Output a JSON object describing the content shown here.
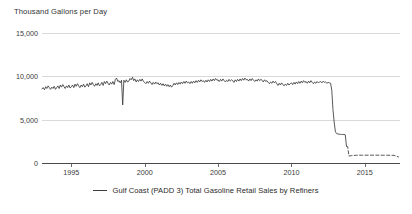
{
  "chart_data": {
    "type": "line",
    "title": "",
    "ylabel": "Thousand Gallons per Day",
    "xlabel": "",
    "ylim": [
      0,
      15000
    ],
    "xlim": [
      1993,
      2017.4
    ],
    "grid": true,
    "legend_position": "bottom-center",
    "yticks": [
      0,
      5000,
      10000,
      15000
    ],
    "ytick_labels": [
      "0",
      "5,000",
      "10,000",
      "15,000"
    ],
    "xticks": [
      1995,
      2000,
      2005,
      2010,
      2015
    ],
    "xtick_labels": [
      "1995",
      "2000",
      "2005",
      "2010",
      "2015"
    ],
    "series": [
      {
        "name": "Gulf Coast (PADD 3) Total Gasoline Retail Sales by Refiners",
        "color": "#3a3a3a",
        "style": "solid",
        "x": [
          1993.0,
          1993.08,
          1993.17,
          1993.25,
          1993.33,
          1993.42,
          1993.5,
          1993.58,
          1993.67,
          1993.75,
          1993.83,
          1993.92,
          1994.0,
          1994.08,
          1994.17,
          1994.25,
          1994.33,
          1994.42,
          1994.5,
          1994.58,
          1994.67,
          1994.75,
          1994.83,
          1994.92,
          1995.0,
          1995.08,
          1995.17,
          1995.25,
          1995.33,
          1995.42,
          1995.5,
          1995.58,
          1995.67,
          1995.75,
          1995.83,
          1995.92,
          1996.0,
          1996.08,
          1996.17,
          1996.25,
          1996.33,
          1996.42,
          1996.5,
          1996.58,
          1996.67,
          1996.75,
          1996.83,
          1996.92,
          1997.0,
          1997.08,
          1997.17,
          1997.25,
          1997.33,
          1997.42,
          1997.5,
          1997.58,
          1997.67,
          1997.75,
          1997.83,
          1997.92,
          1998.0,
          1998.08,
          1998.17,
          1998.25,
          1998.33,
          1998.42,
          1998.5,
          1998.58,
          1998.67,
          1998.75,
          1998.83,
          1998.92,
          1999.0,
          1999.08,
          1999.17,
          1999.25,
          1999.33,
          1999.42,
          1999.5,
          1999.58,
          1999.67,
          1999.75,
          1999.83,
          1999.92,
          2000.0,
          2000.08,
          2000.17,
          2000.25,
          2000.33,
          2000.42,
          2000.5,
          2000.58,
          2000.67,
          2000.75,
          2000.83,
          2000.92,
          2001.0,
          2001.08,
          2001.17,
          2001.25,
          2001.33,
          2001.42,
          2001.5,
          2001.58,
          2001.67,
          2001.75,
          2001.83,
          2001.92,
          2002.0,
          2002.08,
          2002.17,
          2002.25,
          2002.33,
          2002.42,
          2002.5,
          2002.58,
          2002.67,
          2002.75,
          2002.83,
          2002.92,
          2003.0,
          2003.08,
          2003.17,
          2003.25,
          2003.33,
          2003.42,
          2003.5,
          2003.58,
          2003.67,
          2003.75,
          2003.83,
          2003.92,
          2004.0,
          2004.08,
          2004.17,
          2004.25,
          2004.33,
          2004.42,
          2004.5,
          2004.58,
          2004.67,
          2004.75,
          2004.83,
          2004.92,
          2005.0,
          2005.08,
          2005.17,
          2005.25,
          2005.33,
          2005.42,
          2005.5,
          2005.58,
          2005.67,
          2005.75,
          2005.83,
          2005.92,
          2006.0,
          2006.08,
          2006.17,
          2006.25,
          2006.33,
          2006.42,
          2006.5,
          2006.58,
          2006.67,
          2006.75,
          2006.83,
          2006.92,
          2007.0,
          2007.08,
          2007.17,
          2007.25,
          2007.33,
          2007.42,
          2007.5,
          2007.58,
          2007.67,
          2007.75,
          2007.83,
          2007.92,
          2008.0,
          2008.08,
          2008.17,
          2008.25,
          2008.33,
          2008.42,
          2008.5,
          2008.58,
          2008.67,
          2008.75,
          2008.83,
          2008.92,
          2009.0,
          2009.08,
          2009.17,
          2009.25,
          2009.33,
          2009.42,
          2009.5,
          2009.58,
          2009.67,
          2009.75,
          2009.83,
          2009.92,
          2010.0,
          2010.08,
          2010.17,
          2010.25,
          2010.33,
          2010.42,
          2010.5,
          2010.58,
          2010.67,
          2010.75,
          2010.83,
          2010.92,
          2011.0,
          2011.08,
          2011.17,
          2011.25,
          2011.33,
          2011.42,
          2011.5,
          2011.58,
          2011.67,
          2011.75,
          2011.83,
          2011.92,
          2012.0,
          2012.08,
          2012.17,
          2012.25,
          2012.33,
          2012.42,
          2012.5,
          2012.58,
          2012.67,
          2012.75,
          2012.83,
          2012.92,
          2013.0,
          2013.08,
          2013.17,
          2013.25,
          2013.33,
          2013.42,
          2013.5,
          2013.58,
          2013.67,
          2013.75
        ],
        "y": [
          8550,
          8700,
          8450,
          8800,
          8600,
          8900,
          8700,
          8500,
          8750,
          8600,
          8850,
          8500,
          8700,
          8900,
          8600,
          9000,
          8750,
          9050,
          8800,
          8600,
          8900,
          8700,
          9000,
          8650,
          8800,
          9000,
          8700,
          9100,
          8850,
          9150,
          8900,
          8700,
          9000,
          8800,
          9100,
          8750,
          8900,
          9150,
          8800,
          9250,
          9000,
          9300,
          9050,
          8850,
          9150,
          8950,
          9250,
          8900,
          9050,
          9300,
          8950,
          9400,
          9150,
          9450,
          9200,
          9000,
          9300,
          9100,
          9400,
          9050,
          9650,
          9800,
          9400,
          9500,
          9250,
          9550,
          6700,
          9550,
          9300,
          9600,
          9350,
          9450,
          9750,
          9600,
          9900,
          9500,
          9700,
          9350,
          9600,
          9400,
          9650,
          9450,
          9700,
          9400,
          9300,
          9150,
          9400,
          9200,
          9450,
          9250,
          9050,
          9300,
          9100,
          9350,
          9150,
          9250,
          9000,
          9200,
          8950,
          9150,
          8900,
          9100,
          8850,
          9050,
          8800,
          9000,
          8750,
          8950,
          9200,
          9000,
          9250,
          9050,
          9300,
          9100,
          9350,
          9150,
          9400,
          9200,
          9450,
          9250,
          9350,
          9150,
          9400,
          9200,
          9450,
          9250,
          9500,
          9300,
          9550,
          9350,
          9600,
          9400,
          9500,
          9300,
          9550,
          9350,
          9600,
          9400,
          9650,
          9450,
          9700,
          9500,
          9750,
          9550,
          9600,
          9400,
          9650,
          9450,
          9700,
          9500,
          9350,
          9550,
          9400,
          9650,
          9450,
          9600,
          9500,
          9300,
          9600,
          9400,
          9650,
          9450,
          9700,
          9500,
          9750,
          9550,
          9800,
          9600,
          9650,
          9450,
          9700,
          9500,
          9750,
          9550,
          9400,
          9600,
          9450,
          9700,
          9500,
          9650,
          9550,
          9350,
          9600,
          9400,
          9500,
          9300,
          9150,
          9350,
          9200,
          9450,
          9250,
          9400,
          9150,
          8950,
          9200,
          9000,
          9250,
          9050,
          8900,
          9100,
          8950,
          9200,
          9000,
          9150,
          9250,
          9050,
          9300,
          9100,
          9350,
          9150,
          9400,
          9200,
          9450,
          9250,
          9500,
          9300,
          9400,
          9200,
          9450,
          9250,
          9500,
          9300,
          9150,
          9350,
          9200,
          9400,
          9250,
          9350,
          9400,
          9250,
          9450,
          9300,
          9350,
          9200,
          9300,
          9250,
          9200,
          8400,
          6200,
          4600,
          3600,
          3400,
          3350,
          3320,
          3300,
          3300,
          3280,
          3300,
          3250,
          1950
        ]
      },
      {
        "name": "Gulf Coast (PADD 3) Total Gasoline Retail Sales by Refiners (recent)",
        "color": "#3a3a3a",
        "style": "dashed",
        "x": [
          2013.75,
          2013.83,
          2013.92,
          2014.0,
          2014.08,
          2014.17,
          2014.25,
          2014.33,
          2014.42,
          2014.5,
          2014.58,
          2014.67,
          2014.75,
          2014.83,
          2014.92,
          2015.0,
          2015.25,
          2015.5,
          2015.75,
          2016.0,
          2016.25,
          2016.5,
          2016.75,
          2017.0,
          2017.2,
          2017.3
        ],
        "y": [
          1950,
          1900,
          800,
          820,
          850,
          860,
          870,
          880,
          890,
          900,
          900,
          905,
          900,
          900,
          895,
          900,
          905,
          900,
          910,
          900,
          895,
          900,
          890,
          880,
          760,
          700
        ]
      }
    ]
  },
  "legend": {
    "entries": [
      {
        "label": "Gulf Coast (PADD 3) Total Gasoline Retail Sales by Refiners",
        "color": "#3a3a3a"
      }
    ]
  }
}
